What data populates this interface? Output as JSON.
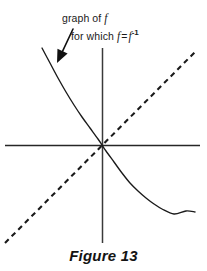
{
  "figure": {
    "caption": "Figure 13",
    "background_color": "#ffffff",
    "ink_color": "#1a1a1a",
    "width": 207,
    "height": 271
  },
  "annotations": {
    "line1_prefix": "graph of ",
    "line1_var": "f",
    "line2_prefix": "for which ",
    "line2_var_a": "f",
    "line2_equals": "=",
    "line2_var_b": "f",
    "line2_exponent": "-1",
    "arrow": {
      "name": "pointer-arrow",
      "from_x": 73,
      "from_y": 29,
      "to_x": 57,
      "to_y": 63
    }
  },
  "chart_data": {
    "type": "line",
    "title": "Figure 13",
    "subtitle": "graph of f for which f = f-1",
    "xlabel": "",
    "ylabel": "",
    "grid": false,
    "legend_position": "none",
    "origin": {
      "x": 102,
      "y": 145
    },
    "axes": {
      "x_axis": {
        "x1": 5,
        "y1": 145,
        "x2": 200,
        "y2": 145,
        "style": "solid"
      },
      "y_axis": {
        "x1": 102,
        "y1": 48,
        "x2": 102,
        "y2": 243,
        "style": "solid"
      }
    },
    "xlim": [
      -4.85,
      4.9
    ],
    "ylim": [
      -4.9,
      4.85
    ],
    "series": [
      {
        "name": "graph of f (self-inverse, decreasing)",
        "style": "solid",
        "color": "#1a1a1a",
        "points": [
          [
            -3.0,
            4.85
          ],
          [
            -2.6,
            4.1
          ],
          [
            -2.2,
            3.35
          ],
          [
            -1.8,
            2.65
          ],
          [
            -1.4,
            2.0
          ],
          [
            -1.0,
            1.4
          ],
          [
            -0.6,
            0.85
          ],
          [
            -0.2,
            0.3
          ],
          [
            0.0,
            0.0
          ],
          [
            0.2,
            -0.3
          ],
          [
            0.6,
            -0.85
          ],
          [
            1.0,
            -1.4
          ],
          [
            1.4,
            -1.9
          ],
          [
            1.8,
            -2.3
          ],
          [
            2.2,
            -2.65
          ],
          [
            2.6,
            -2.95
          ],
          [
            3.0,
            -3.2
          ],
          [
            3.6,
            -3.45
          ],
          [
            4.2,
            -3.3
          ],
          [
            4.65,
            -3.35
          ]
        ]
      },
      {
        "name": "line y = x (axis of symmetry)",
        "style": "dashed",
        "color": "#1a1a1a",
        "points": [
          [
            -4.85,
            -4.9
          ],
          [
            4.75,
            4.75
          ]
        ]
      }
    ]
  }
}
